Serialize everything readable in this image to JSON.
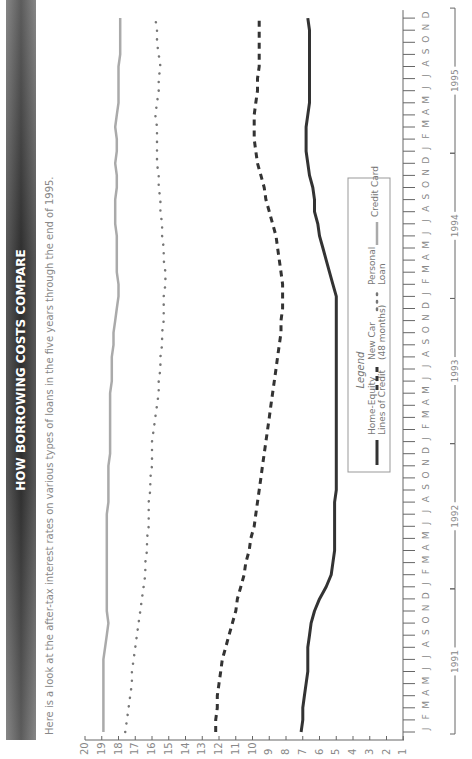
{
  "chart_data": {
    "type": "line",
    "title": "HOW BORROWING COSTS COMPARE",
    "subtitle": "Here is a look at the after-tax interest rates on various types of loans in the five years through the end of 1995.",
    "xlabel": "",
    "ylabel": "",
    "orientation": "rotated-90-ccw",
    "ylim": [
      0,
      20
    ],
    "yticks": [
      1,
      2,
      3,
      4,
      5,
      6,
      7,
      8,
      9,
      10,
      11,
      12,
      13,
      14,
      15,
      16,
      17,
      18,
      19,
      20
    ],
    "month_letters": [
      "J",
      "F",
      "M",
      "A",
      "M",
      "J",
      "J",
      "A",
      "S",
      "O",
      "N",
      "D"
    ],
    "years": [
      "1991",
      "1992",
      "1993",
      "1994",
      "1995"
    ],
    "grid": false,
    "legend_title": "Legend",
    "legend_placement": "center-right",
    "series": [
      {
        "name": "Home-Equity Lines of Credit",
        "legend_lines": [
          "Home-Equity",
          "Lines of Credit"
        ],
        "style": "solid-dark",
        "color": "#333333",
        "values": [
          7.1,
          7.0,
          7.0,
          6.9,
          6.8,
          6.7,
          6.7,
          6.7,
          6.6,
          6.5,
          6.3,
          6.0,
          5.6,
          5.3,
          5.2,
          5.1,
          5.1,
          5.1,
          5.1,
          5.1,
          5.0,
          5.0,
          5.0,
          5.0,
          5.0,
          5.0,
          5.0,
          5.0,
          5.0,
          5.0,
          5.0,
          5.0,
          5.0,
          5.0,
          5.0,
          5.0,
          5.0,
          5.2,
          5.4,
          5.6,
          5.8,
          6.0,
          6.1,
          6.3,
          6.3,
          6.4,
          6.6,
          6.7,
          6.8,
          6.8,
          6.8,
          6.7,
          6.6,
          6.6,
          6.6,
          6.6,
          6.6,
          6.6,
          6.6,
          6.7
        ]
      },
      {
        "name": "New Car (48 months)",
        "legend_lines": [
          "New Car",
          "(48 months)"
        ],
        "style": "dashed-dark",
        "color": "#333333",
        "values": [
          12.2,
          12.2,
          12.1,
          12.1,
          12.0,
          11.9,
          11.8,
          11.6,
          11.4,
          11.2,
          11.0,
          10.9,
          10.7,
          10.5,
          10.4,
          10.2,
          10.1,
          9.9,
          9.8,
          9.7,
          9.6,
          9.5,
          9.4,
          9.3,
          9.2,
          9.1,
          9.0,
          8.9,
          8.8,
          8.7,
          8.6,
          8.5,
          8.4,
          8.3,
          8.3,
          8.2,
          8.2,
          8.2,
          8.3,
          8.4,
          8.5,
          8.6,
          8.8,
          9.0,
          9.2,
          9.3,
          9.5,
          9.7,
          9.8,
          9.9,
          9.9,
          9.9,
          9.8,
          9.7,
          9.7,
          9.6,
          9.6,
          9.6,
          9.6,
          9.6
        ]
      },
      {
        "name": "Personal Loan",
        "legend_lines": [
          "Personal",
          "Loan"
        ],
        "style": "dotted-gray",
        "color": "#777777",
        "values": [
          17.6,
          17.5,
          17.4,
          17.3,
          17.2,
          17.2,
          17.1,
          17.0,
          16.9,
          16.8,
          16.7,
          16.6,
          16.5,
          16.4,
          16.4,
          16.3,
          16.3,
          16.2,
          16.2,
          16.2,
          16.1,
          16.1,
          16.0,
          16.0,
          16.0,
          15.9,
          15.8,
          15.7,
          15.6,
          15.6,
          15.5,
          15.5,
          15.4,
          15.4,
          15.3,
          15.3,
          15.3,
          15.2,
          15.2,
          15.3,
          15.3,
          15.4,
          15.4,
          15.5,
          15.5,
          15.6,
          15.6,
          15.7,
          15.7,
          15.7,
          15.7,
          15.8,
          15.7,
          15.6,
          15.6,
          15.5,
          15.6,
          15.7,
          15.7,
          15.8
        ]
      },
      {
        "name": "Credit Card",
        "legend_lines": [
          "Credit Card"
        ],
        "style": "solid-gray",
        "color": "#aaaaaa",
        "values": [
          18.9,
          18.9,
          18.9,
          18.9,
          18.9,
          18.9,
          18.9,
          18.8,
          18.7,
          18.6,
          18.7,
          18.7,
          18.7,
          18.7,
          18.7,
          18.7,
          18.7,
          18.7,
          18.7,
          18.6,
          18.6,
          18.6,
          18.6,
          18.5,
          18.5,
          18.5,
          18.5,
          18.5,
          18.5,
          18.4,
          18.4,
          18.4,
          18.3,
          18.3,
          18.2,
          18.1,
          18.0,
          18.0,
          18.1,
          18.1,
          18.1,
          18.1,
          18.2,
          18.2,
          18.2,
          18.1,
          18.1,
          18.2,
          18.1,
          18.1,
          18.2,
          18.1,
          18.0,
          18.0,
          18.0,
          18.0,
          17.9,
          17.9,
          17.9,
          17.9
        ]
      }
    ]
  }
}
